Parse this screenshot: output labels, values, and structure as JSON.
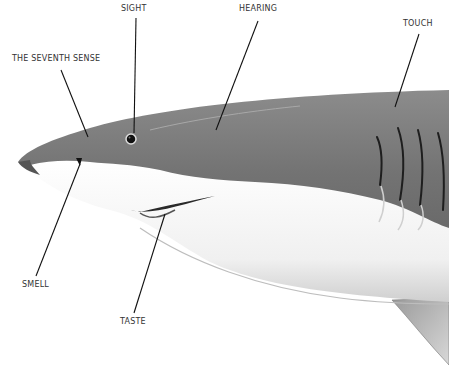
{
  "diagram": {
    "labels": [
      {
        "id": "sight",
        "text": "SIGHT",
        "x": 121,
        "y": 4,
        "points_to": "eye"
      },
      {
        "id": "hearing",
        "text": "HEARING",
        "x": 239,
        "y": 4,
        "points_to": "head behind eye"
      },
      {
        "id": "touch",
        "text": "TOUCH",
        "x": 403,
        "y": 19,
        "points_to": "lateral line / body"
      },
      {
        "id": "seventh_sense",
        "text": "THE SEVENTH SENSE",
        "x": 12,
        "y": 54,
        "points_to": "snout (electroreception)"
      },
      {
        "id": "smell",
        "text": "SMELL",
        "x": 22,
        "y": 280,
        "points_to": "nostril"
      },
      {
        "id": "taste",
        "text": "TASTE",
        "x": 120,
        "y": 317,
        "points_to": "mouth"
      }
    ],
    "colors": {
      "background": "#ffffff",
      "label_text": "#333333",
      "leader_line": "#111111",
      "shark_dorsal": "#7a7a7a",
      "shark_belly": "#f2f2f2"
    }
  }
}
